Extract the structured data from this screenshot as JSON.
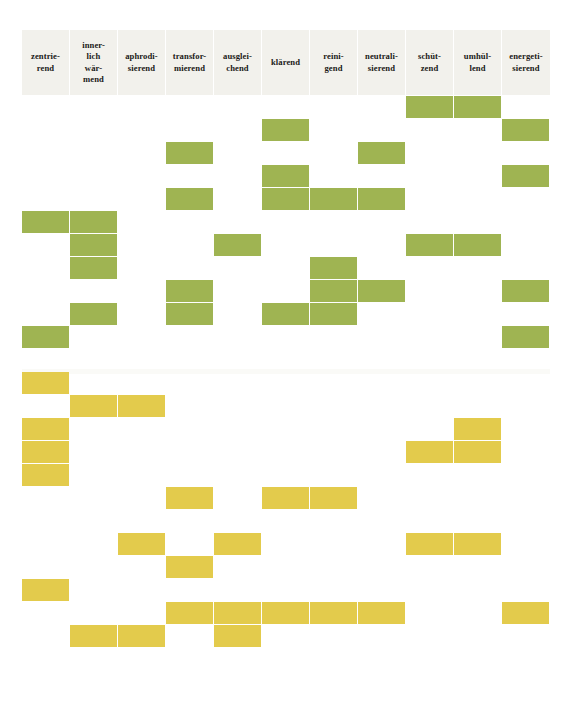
{
  "table": {
    "columns": [
      {
        "id": "zentrierend",
        "label": "zentrie-\nrend"
      },
      {
        "id": "innerlich-waermend",
        "label": "inner-\nlich\nwär-\nmend"
      },
      {
        "id": "aphrodisierend",
        "label": "aphrodi-\nsierend"
      },
      {
        "id": "transformierend",
        "label": "transfor-\nmierend"
      },
      {
        "id": "ausgleichend",
        "label": "ausglei-\nchend"
      },
      {
        "id": "klaerend",
        "label": "klärend"
      },
      {
        "id": "reinigend",
        "label": "reini-\ngend"
      },
      {
        "id": "neutralisierend",
        "label": "neutrali-\nsierend"
      },
      {
        "id": "schuetzend",
        "label": "schüt-\nzend"
      },
      {
        "id": "umhuellend",
        "label": "umhül-\nlend"
      },
      {
        "id": "energetisierend",
        "label": "energeti-\nsierend"
      }
    ],
    "colors": {
      "green": "#9fb452",
      "yellow": "#e3cb4c",
      "header_background": "#f2f1ec",
      "page_background": "#ffffff",
      "header_text": "#1a1a18"
    },
    "geometry": {
      "grid_left": 22,
      "grid_top": 96,
      "col_width": 48,
      "row_height": 23,
      "cell_width": 47,
      "cell_height": 22,
      "header_top": 30,
      "header_height": 65,
      "columns_count": 11,
      "rows_count": 26
    },
    "marks": [
      {
        "row": 0,
        "col": 8,
        "color": "green"
      },
      {
        "row": 0,
        "col": 9,
        "color": "green"
      },
      {
        "row": 1,
        "col": 5,
        "color": "green"
      },
      {
        "row": 1,
        "col": 10,
        "color": "green"
      },
      {
        "row": 2,
        "col": 3,
        "color": "green"
      },
      {
        "row": 2,
        "col": 7,
        "color": "green"
      },
      {
        "row": 3,
        "col": 5,
        "color": "green"
      },
      {
        "row": 3,
        "col": 10,
        "color": "green"
      },
      {
        "row": 4,
        "col": 3,
        "color": "green"
      },
      {
        "row": 4,
        "col": 5,
        "color": "green"
      },
      {
        "row": 4,
        "col": 6,
        "color": "green"
      },
      {
        "row": 4,
        "col": 7,
        "color": "green"
      },
      {
        "row": 5,
        "col": 0,
        "color": "green"
      },
      {
        "row": 5,
        "col": 1,
        "color": "green"
      },
      {
        "row": 6,
        "col": 1,
        "color": "green"
      },
      {
        "row": 6,
        "col": 4,
        "color": "green"
      },
      {
        "row": 6,
        "col": 8,
        "color": "green"
      },
      {
        "row": 6,
        "col": 9,
        "color": "green"
      },
      {
        "row": 7,
        "col": 1,
        "color": "green"
      },
      {
        "row": 7,
        "col": 6,
        "color": "green"
      },
      {
        "row": 8,
        "col": 3,
        "color": "green"
      },
      {
        "row": 8,
        "col": 6,
        "color": "green"
      },
      {
        "row": 8,
        "col": 7,
        "color": "green"
      },
      {
        "row": 8,
        "col": 10,
        "color": "green"
      },
      {
        "row": 9,
        "col": 1,
        "color": "green"
      },
      {
        "row": 9,
        "col": 3,
        "color": "green"
      },
      {
        "row": 9,
        "col": 5,
        "color": "green"
      },
      {
        "row": 9,
        "col": 6,
        "color": "green"
      },
      {
        "row": 10,
        "col": 0,
        "color": "green"
      },
      {
        "row": 10,
        "col": 10,
        "color": "green"
      },
      {
        "row": 12,
        "col": 0,
        "color": "yellow"
      },
      {
        "row": 13,
        "col": 1,
        "color": "yellow"
      },
      {
        "row": 13,
        "col": 2,
        "color": "yellow"
      },
      {
        "row": 14,
        "col": 0,
        "color": "yellow"
      },
      {
        "row": 14,
        "col": 9,
        "color": "yellow"
      },
      {
        "row": 15,
        "col": 0,
        "color": "yellow"
      },
      {
        "row": 15,
        "col": 8,
        "color": "yellow"
      },
      {
        "row": 15,
        "col": 9,
        "color": "yellow"
      },
      {
        "row": 16,
        "col": 0,
        "color": "yellow"
      },
      {
        "row": 17,
        "col": 3,
        "color": "yellow"
      },
      {
        "row": 17,
        "col": 5,
        "color": "yellow"
      },
      {
        "row": 17,
        "col": 6,
        "color": "yellow"
      },
      {
        "row": 19,
        "col": 2,
        "color": "yellow"
      },
      {
        "row": 19,
        "col": 4,
        "color": "yellow"
      },
      {
        "row": 19,
        "col": 8,
        "color": "yellow"
      },
      {
        "row": 19,
        "col": 9,
        "color": "yellow"
      },
      {
        "row": 20,
        "col": 3,
        "color": "yellow"
      },
      {
        "row": 21,
        "col": 0,
        "color": "yellow"
      },
      {
        "row": 22,
        "col": 3,
        "color": "yellow"
      },
      {
        "row": 22,
        "col": 4,
        "color": "yellow"
      },
      {
        "row": 22,
        "col": 5,
        "color": "yellow"
      },
      {
        "row": 22,
        "col": 6,
        "color": "yellow"
      },
      {
        "row": 22,
        "col": 7,
        "color": "yellow"
      },
      {
        "row": 22,
        "col": 10,
        "color": "yellow"
      },
      {
        "row": 23,
        "col": 1,
        "color": "yellow"
      },
      {
        "row": 23,
        "col": 2,
        "color": "yellow"
      },
      {
        "row": 23,
        "col": 4,
        "color": "yellow"
      }
    ]
  }
}
